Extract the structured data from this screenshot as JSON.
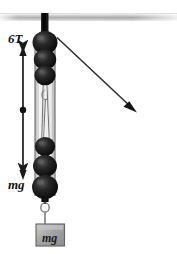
{
  "figure": {
    "width": 177,
    "height": 254,
    "background_color": "#ffffff"
  },
  "labels": {
    "tension": "6T",
    "weight_arrow": "mg",
    "weight_block": "mg"
  },
  "colors": {
    "ceiling_light": "#f2f2f2",
    "ceiling_mid": "#b8b8b8",
    "ceiling_dark": "#8f8f8f",
    "pulley_dark": "#141414",
    "pulley_highlight": "#4a4a4a",
    "rope": "#6e6e6e",
    "frame_light": "#e6e6e6",
    "frame_edge": "#9a9a9a",
    "block_fill": "#a8a8a8",
    "block_edge": "#5a5a5a",
    "arrow": "#1a1a1a",
    "text": "#111111"
  },
  "elements": {
    "ceiling": {
      "name": "ceiling-beam",
      "x": 0,
      "y": 13,
      "width": 177,
      "height": 8
    },
    "support_rod": {
      "name": "support-rod",
      "x": 41,
      "y": 13,
      "width": 7,
      "height": 22
    },
    "upper_block": {
      "name": "upper-pulley-block",
      "pulley_count": 3,
      "center_x": 45,
      "pulley_centers_y": [
        42,
        58,
        73
      ],
      "pulley_radius": 11
    },
    "lower_block": {
      "name": "lower-pulley-block",
      "pulley_count": 3,
      "center_x": 45,
      "pulley_centers_y": [
        145,
        164,
        184
      ],
      "pulley_radius": 11
    },
    "frame": {
      "name": "pulley-frame",
      "x": 35,
      "y": 40,
      "width": 20,
      "height": 155
    },
    "hanging_weight": {
      "name": "hanging-weight-block",
      "x": 36,
      "y": 224,
      "width": 28,
      "height": 22,
      "hook_x": 46,
      "hook_y": 205
    },
    "force_arrow": {
      "name": "force-double-arrow",
      "x": 23,
      "y_top": 47,
      "y_bottom": 180,
      "dot_y": 110,
      "dot_radius": 3
    },
    "pull_arrow": {
      "name": "pull-direction-arrow",
      "x1": 57,
      "y1": 37,
      "x2": 136,
      "y2": 111
    }
  }
}
